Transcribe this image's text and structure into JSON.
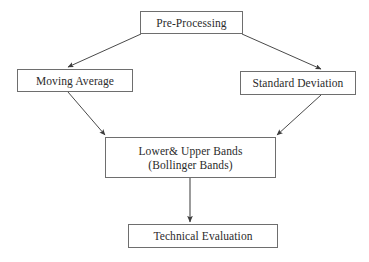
{
  "diagram": {
    "background_color": "#ffffff",
    "line_color": "#4a4a4a",
    "box_border_color": "#6e6e6e",
    "text_color": "#2b2b2b",
    "nodes": [
      {
        "id": "pre-processing",
        "lines": [
          "Pre-Processing"
        ],
        "x": 140,
        "y": 11,
        "w": 103,
        "h": 23
      },
      {
        "id": "moving-average",
        "lines": [
          "Moving Average"
        ],
        "x": 17,
        "y": 69,
        "w": 116,
        "h": 23
      },
      {
        "id": "standard-deviation",
        "lines": [
          "Standard Deviation"
        ],
        "x": 240,
        "y": 71,
        "w": 116,
        "h": 24
      },
      {
        "id": "bollinger-bands",
        "lines": [
          "Lower& Upper Bands",
          "(Bollinger Bands)"
        ],
        "x": 105,
        "y": 137,
        "w": 171,
        "h": 41
      },
      {
        "id": "technical-evaluation",
        "lines": [
          "Technical Evaluation"
        ],
        "x": 128,
        "y": 224,
        "w": 150,
        "h": 24
      }
    ],
    "edges": [
      {
        "id": "pre-processing-to-moving-average",
        "from": "pre-processing",
        "to": "moving-average",
        "x1": 141,
        "y1": 34,
        "x2": 68,
        "y2": 68
      },
      {
        "id": "pre-processing-to-standard-deviation",
        "from": "pre-processing",
        "to": "standard-deviation",
        "x1": 242,
        "y1": 34,
        "x2": 321,
        "y2": 70
      },
      {
        "id": "moving-average-to-bollinger-bands",
        "from": "moving-average",
        "to": "bollinger-bands",
        "x1": 68,
        "y1": 92,
        "x2": 106,
        "y2": 136
      },
      {
        "id": "standard-deviation-to-bollinger-bands",
        "from": "standard-deviation",
        "to": "bollinger-bands",
        "x1": 321,
        "y1": 95,
        "x2": 276,
        "y2": 136
      },
      {
        "id": "bollinger-bands-to-technical-evaluation",
        "from": "bollinger-bands",
        "to": "technical-evaluation",
        "x1": 190,
        "y1": 178,
        "x2": 190,
        "y2": 223
      }
    ]
  }
}
